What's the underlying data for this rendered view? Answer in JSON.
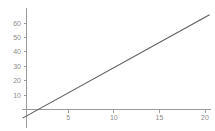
{
  "chart_data": {
    "type": "line",
    "title": "",
    "subtitle": "",
    "xlabel": "",
    "ylabel": "",
    "grid": false,
    "legend": "none",
    "xlim": [
      -1.2,
      21.2
    ],
    "ylim": [
      -13,
      68
    ],
    "x_ticks": [
      5,
      10,
      15,
      20
    ],
    "y_ticks": [
      10,
      20,
      30,
      40,
      50,
      60
    ],
    "x_tick_labels": [
      "5",
      "10",
      "15",
      "20"
    ],
    "y_tick_labels": [
      "10",
      "20",
      "30",
      "40",
      "50",
      "60"
    ],
    "series": [
      {
        "name": "line",
        "color": "#5a5a5a",
        "x": [
          0,
          20.5
        ],
        "y": [
          -6,
          65.75
        ],
        "slope": 3.5,
        "intercept": -6,
        "x_intercept": 1.71
      }
    ],
    "axis_color": "#9a9a9a",
    "tick_label_color": "#8c8c8c",
    "background_color": "#ffffff"
  },
  "plot": {
    "aria_label": "Line plot of a straight increasing line crossing the x axis near x equals 2"
  }
}
